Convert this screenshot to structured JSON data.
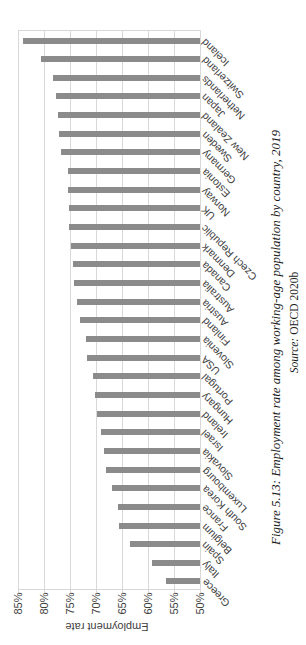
{
  "chart_data": {
    "type": "bar",
    "title": "",
    "categories": [
      "Iceland",
      "Switzerland",
      "Netherlands",
      "Japan",
      "New Zealand",
      "Sweden",
      "Germany",
      "Estonia",
      "Norway",
      "UK",
      "Czech Republic",
      "Denmark",
      "Canada",
      "Australia",
      "Austria",
      "Finland",
      "Slovenia",
      "USA",
      "Portugal",
      "Hungary",
      "Ireland",
      "Israel",
      "Slovakia",
      "Luxembourg",
      "South Korea",
      "France",
      "Belgium",
      "Spain",
      "Italy",
      "Greece"
    ],
    "values": [
      84.1,
      80.5,
      78.2,
      77.6,
      77.4,
      77.1,
      76.7,
      75.4,
      75.3,
      75.2,
      75.1,
      74.8,
      74.5,
      74.2,
      73.7,
      73.1,
      72.0,
      71.7,
      70.6,
      70.2,
      69.9,
      69.1,
      68.5,
      68.0,
      67.0,
      65.7,
      65.5,
      63.4,
      59.2,
      56.6
    ],
    "ylabel": "Employment rate",
    "ylim": [
      50,
      85
    ],
    "yticks": [
      50,
      55,
      60,
      65,
      70,
      75,
      80,
      85
    ],
    "ytick_labels": [
      "50%",
      "55%",
      "60%",
      "65%",
      "70%",
      "75%",
      "80%",
      "85%"
    ],
    "grid": true,
    "legend": false,
    "sort_order": "descending",
    "bar_color": "#8b8b8b",
    "gridline_color": "#d8d8d8"
  },
  "caption": {
    "text": "Figure 5.13: Employment rate among working-age population by country, 2019",
    "source_prefix": "Source:",
    "source_value": "OECD 2020b"
  }
}
